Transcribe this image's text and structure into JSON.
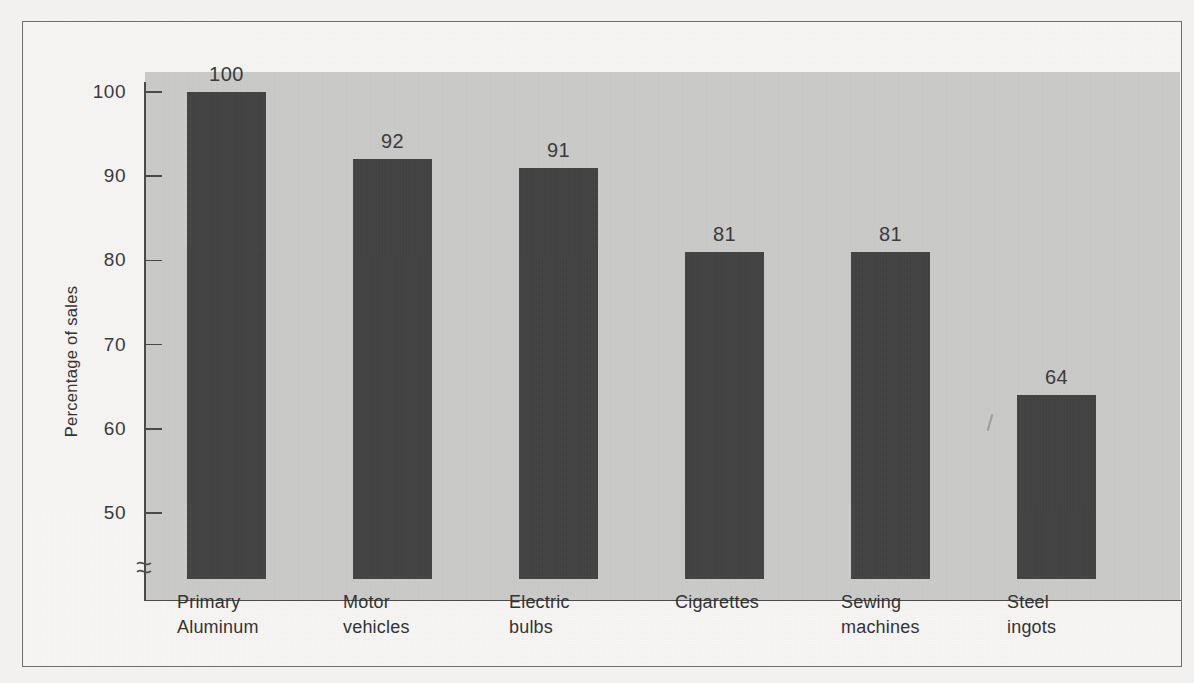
{
  "chart_data": {
    "type": "bar",
    "title": "",
    "xlabel": "",
    "ylabel": "Percentage of sales",
    "categories": [
      "Primary\nAluminum",
      "Motor\nvehicles",
      "Electric\nbulbs",
      "Cigarettes",
      "Sewing\nmachines",
      "Steel\ningots"
    ],
    "values": [
      100,
      92,
      91,
      81,
      81,
      64
    ],
    "value_labels": [
      "100",
      "92",
      "91",
      "81",
      "81",
      "64"
    ],
    "ylim": [
      44,
      104
    ],
    "yticks": [
      50,
      60,
      70,
      80,
      90,
      100
    ],
    "ytick_labels": [
      "50",
      "60",
      "70",
      "80",
      "90",
      "100"
    ],
    "axis_break": true,
    "axis_break_glyph": "≈",
    "grid": false,
    "legend": "none",
    "colors": {
      "bar": "#434343",
      "plot_background": "#c9c9c8",
      "page_background": "#f6f5f3",
      "axis": "#4a4a4a",
      "text": "#333333",
      "frame": "#6f6f6f"
    }
  },
  "figure": {
    "frame_visible": true,
    "annotations": [
      {
        "name": "stray-pencil-mark",
        "text": ""
      }
    ]
  }
}
